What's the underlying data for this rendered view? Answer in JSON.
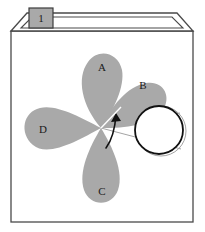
{
  "figure": {
    "tab": {
      "label": "1",
      "fill_color": "#a9a9a9",
      "stroke_color": "#3c3c3c"
    },
    "box": {
      "name": "open-box-container",
      "stroke_color": "#4a4a4a",
      "fill_color": "#ffffff"
    },
    "petals": [
      {
        "id": "A",
        "label": "A",
        "angle_deg": -90,
        "label_x": 102,
        "label_y": 68
      },
      {
        "id": "B",
        "label": "B",
        "angle_deg": -35,
        "label_x": 143,
        "label_y": 86
      },
      {
        "id": "C",
        "label": "C",
        "angle_deg": 90,
        "label_x": 102,
        "label_y": 192
      },
      {
        "id": "D",
        "label": "D",
        "angle_deg": 180,
        "label_x": 43,
        "label_y": 130
      }
    ],
    "petal_fill_color": "#a9a9a9",
    "hub": {
      "x": 101,
      "y": 128
    },
    "circle": {
      "name": "roller-circle",
      "cx": 159,
      "cy": 130,
      "r": 24,
      "stroke_color": "#111111",
      "fill_color": "#ffffff"
    },
    "ghost_circle": {
      "cx": 161,
      "cy": 131,
      "r": 25,
      "stroke_color": "#9a9a9a"
    },
    "tangent_lines_color": "#9a9a9a",
    "rotation_arrow": {
      "name": "rotation-arrow",
      "color": "#111111",
      "direction": "counter-clockwise"
    }
  }
}
